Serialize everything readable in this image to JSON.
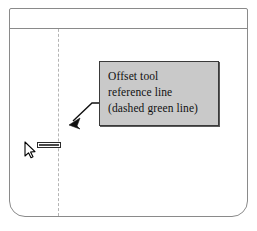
{
  "window": {
    "name": "drawing-application-window",
    "background_color": "#ffffff",
    "border_color": "#8a8a8a"
  },
  "toolbar": {
    "name": "toolbar-strip",
    "divider_color": "#8a8a8a"
  },
  "canvas": {
    "name": "drawing-canvas",
    "reference_line": {
      "label": "offset-tool-reference-line",
      "style": "dashed",
      "color_described": "green",
      "rendered_color": "#b4b4b4",
      "orientation": "vertical"
    }
  },
  "callout": {
    "name": "annotation-callout",
    "background_color": "#c9c9c9",
    "border_color": "#3a3a3a",
    "text_color": "#111111",
    "lines": [
      "Offset tool",
      "reference line",
      "(dashed green line)"
    ]
  },
  "leader": {
    "name": "leader-arrow",
    "color": "#111111",
    "points": "from callout left edge to reference line"
  },
  "cursor": {
    "name": "mouse-pointer",
    "color": "#000000"
  },
  "offset_readout": {
    "name": "offset-value-readout",
    "border_color": "#2b2b2b",
    "fill_color": "#ffffff"
  }
}
